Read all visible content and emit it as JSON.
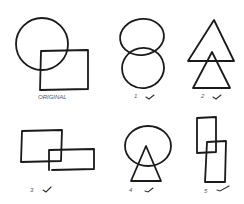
{
  "figures": [
    {
      "id": "original",
      "label": "ORIGINAL",
      "description": "circle overlapping square",
      "checked": false
    },
    {
      "id": "1",
      "label": "1",
      "description": "two overlapping ovals stacked vertically",
      "checked": true
    },
    {
      "id": "2",
      "label": "2",
      "description": "two overlapping triangles stacked vertically",
      "checked": true
    },
    {
      "id": "3",
      "label": "3",
      "description": "two overlapping rectangles offset diagonally",
      "checked": true
    },
    {
      "id": "4",
      "label": "4",
      "description": "circle overlapping triangle below",
      "checked": true
    },
    {
      "id": "5",
      "label": "5",
      "description": "two overlapping tall rectangles offset diagonally",
      "checked": true
    }
  ],
  "check_symbol": "✓"
}
